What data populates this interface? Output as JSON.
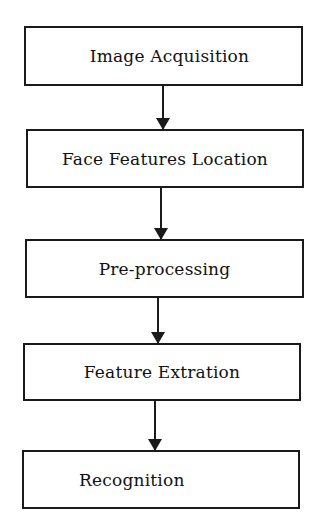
{
  "diagram": {
    "type": "flowchart",
    "direction": "top-to-bottom",
    "steps": [
      {
        "label": "Image Acquisition"
      },
      {
        "label": "Face Features Location"
      },
      {
        "label": "Pre-processing"
      },
      {
        "label": "Feature Extration"
      },
      {
        "label": "Recognition"
      }
    ],
    "edges": [
      {
        "from": "Image Acquisition",
        "to": "Face Features Location"
      },
      {
        "from": "Face Features Location",
        "to": "Pre-processing"
      },
      {
        "from": "Pre-processing",
        "to": "Feature Extration"
      },
      {
        "from": "Feature Extration",
        "to": "Recognition"
      }
    ],
    "colors": {
      "stroke": "#1a1a1a",
      "background": "#ffffff",
      "text": "#111111"
    }
  }
}
